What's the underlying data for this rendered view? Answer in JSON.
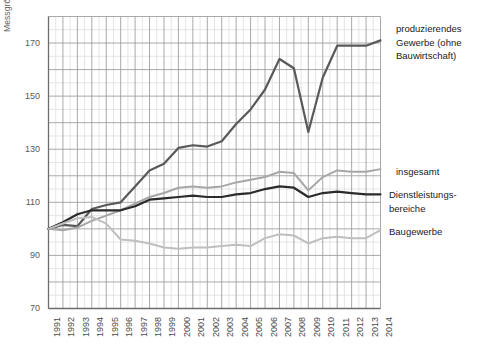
{
  "chart_data": {
    "type": "line",
    "title": "",
    "subtitle": "",
    "xlabel": "",
    "ylabel": "Messgrösse [%]",
    "xlim": [
      1991,
      2014
    ],
    "ylim": [
      70,
      180
    ],
    "yticks": [
      70,
      90,
      110,
      130,
      150,
      170
    ],
    "grid": true,
    "grid_minor": true,
    "legend_position": "right",
    "x": [
      1991,
      1992,
      1993,
      1994,
      1995,
      1996,
      1997,
      1998,
      1999,
      2000,
      2001,
      2002,
      2003,
      2004,
      2005,
      2006,
      2007,
      2008,
      2009,
      2010,
      2011,
      2012,
      2013,
      2014
    ],
    "categories": [
      "1991",
      "1992",
      "1993",
      "1994",
      "1995",
      "1996",
      "1997",
      "1998",
      "1999",
      "2000",
      "2001",
      "2002",
      "2003",
      "2004",
      "2005",
      "2006",
      "2007",
      "2008",
      "2009",
      "2010",
      "2011",
      "2012",
      "2013",
      "2014"
    ],
    "series": [
      {
        "name": "produzierendes Gewerbe (ohne Bauwirtschaft)",
        "color": "#595959",
        "width": 2.2,
        "values": [
          100.0,
          101.5,
          101.0,
          107.5,
          109.0,
          110.0,
          116.0,
          122.0,
          124.5,
          130.5,
          131.5,
          131.0,
          133.0,
          139.5,
          145.0,
          152.5,
          164.0,
          160.5,
          136.5,
          157.0,
          169.0,
          169.0,
          169.0,
          171.0
        ]
      },
      {
        "name": "insgesamt",
        "color": "#a6a6a6",
        "width": 2.0,
        "values": [
          100.0,
          99.5,
          100.5,
          103.0,
          105.0,
          107.0,
          109.5,
          112.0,
          113.5,
          115.5,
          116.0,
          115.5,
          116.0,
          117.5,
          118.5,
          119.5,
          121.5,
          121.0,
          114.5,
          119.5,
          122.0,
          121.5,
          121.5,
          122.5
        ]
      },
      {
        "name": "Dienstleistungsbereiche",
        "color": "#2b2b2b",
        "width": 2.2,
        "values": [
          100.0,
          102.5,
          105.5,
          107.0,
          107.0,
          107.0,
          108.5,
          111.0,
          111.5,
          112.0,
          112.5,
          112.0,
          112.0,
          113.0,
          113.5,
          115.0,
          116.0,
          115.5,
          112.0,
          113.5,
          114.0,
          113.5,
          113.0,
          113.0
        ]
      },
      {
        "name": "Baugewerbe",
        "color": "#bfbfbf",
        "width": 2.0,
        "values": [
          100.0,
          102.0,
          104.0,
          104.5,
          102.0,
          96.0,
          95.5,
          94.5,
          93.0,
          92.5,
          93.0,
          93.0,
          93.5,
          94.0,
          93.5,
          96.5,
          98.0,
          97.5,
          94.5,
          96.5,
          97.0,
          96.5,
          96.5,
          99.5
        ]
      }
    ],
    "annotations": [
      {
        "text": "produzierendes\nGewerbe (ohne\nBauwirtschaft)",
        "x": 396,
        "y": 22
      },
      {
        "text": "insgesamt",
        "x": 396,
        "y": 165
      },
      {
        "text": "Dienstleistungs-\nbereiche",
        "x": 389,
        "y": 188
      },
      {
        "text": "Baugewerbe",
        "x": 389,
        "y": 225
      }
    ]
  },
  "axes": {
    "y_tick_labels": [
      "170",
      "150",
      "130",
      "110",
      "90",
      "70"
    ],
    "y_tick_positions": [
      43.5,
      96.5,
      149.5,
      202.5,
      255.5,
      308.5
    ],
    "x_tick_labels": [
      "1991",
      "1992",
      "1993",
      "1994",
      "1995",
      "1996",
      "1997",
      "1998",
      "1999",
      "2000",
      "2001",
      "2002",
      "2003",
      "2004",
      "2005",
      "2006",
      "2007",
      "2008",
      "2009",
      "2010",
      "2011",
      "2012",
      "2013",
      "2014"
    ]
  },
  "colors": {
    "grid_major": "#9a9a9a",
    "grid_minor": "#dedede",
    "axis": "#8a8a8a",
    "background": "#ffffff",
    "produzierendes": "#595959",
    "insgesamt": "#a6a6a6",
    "dienstleistung": "#2b2b2b",
    "baugewerbe": "#bfbfbf"
  }
}
